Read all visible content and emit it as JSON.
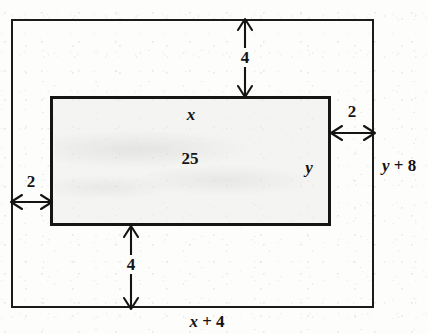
{
  "figure": {
    "type": "geometry-diagram",
    "shapes": {
      "outer_rectangle": {
        "name": "outer-rectangle"
      },
      "inner_rectangle": {
        "name": "inner-rectangle",
        "area_label": "25"
      }
    },
    "labels": {
      "inner_top": "x",
      "inner_area": "25",
      "inner_right": "y",
      "outer_bottom": "x + 4",
      "outer_right": "y + 8",
      "gap_top": "4",
      "gap_bottom": "4",
      "gap_left": "2",
      "gap_right": "2"
    },
    "expression_parts": {
      "outer_bottom": {
        "var": "x",
        "op": "+",
        "num": "4"
      },
      "outer_right": {
        "var": "y",
        "op": "+",
        "num": "8"
      }
    },
    "colors": {
      "ink": "#141414",
      "paper": "#fdfdfc",
      "inner_fill": "#ecece a"
    }
  }
}
